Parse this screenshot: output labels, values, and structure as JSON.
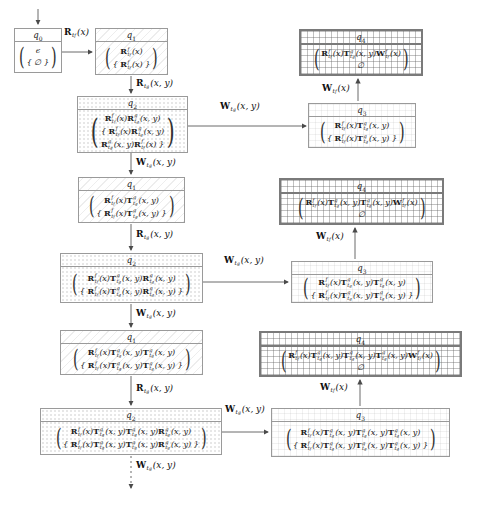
{
  "figure": {
    "states": {
      "q0": {
        "name": "q",
        "sub": "0",
        "kind": "q0",
        "lines": [
          [
            {
              "txt": "ϵ"
            }
          ],
          [
            {
              "txt": "{ ∅ }"
            }
          ]
        ]
      },
      "q1a": {
        "name": "q",
        "sub": "1",
        "kind": "q1",
        "lines": [
          [
            {
              "b": "R",
              "p": "f",
              "s": "t",
              "ss": "f",
              "a": "(x)"
            }
          ],
          [
            {
              "txt": "{ "
            },
            {
              "b": "R",
              "p": "f",
              "s": "t",
              "ss": "f",
              "a": "(x)"
            },
            {
              "txt": " }"
            }
          ]
        ]
      },
      "q2a": {
        "name": "q",
        "sub": "2",
        "kind": "q2",
        "lines": [
          [
            {
              "b": "R",
              "p": "f",
              "s": "t",
              "ss": "f",
              "a": "(x)"
            },
            {
              "b": "R",
              "p": "g",
              "s": "t",
              "ss": "g",
              "a": "(x, y)"
            }
          ],
          [
            {
              "txt": "{ "
            },
            {
              "b": "R",
              "p": "f",
              "s": "t",
              "ss": "f",
              "a": "(x)"
            },
            {
              "b": "R",
              "p": "g",
              "s": "t",
              "ss": "g",
              "a": "(x, y)"
            }
          ],
          [
            {
              "b": "R",
              "p": "g",
              "s": "t",
              "ss": "g",
              "a": "(x, y)"
            },
            {
              "b": "R",
              "p": "f",
              "s": "t",
              "ss": "f",
              "a": "(x)"
            },
            {
              "txt": " }"
            }
          ]
        ]
      },
      "q3a": {
        "name": "q",
        "sub": "3",
        "kind": "q3",
        "lines": [
          [
            {
              "b": "R",
              "p": "f",
              "s": "t",
              "ss": "f",
              "a": "(x)"
            },
            {
              "b": "T",
              "p": "g",
              "s": "t",
              "ss": "g",
              "a": "(x, y)"
            }
          ],
          [
            {
              "txt": "{ "
            },
            {
              "b": "R",
              "p": "f",
              "s": "t",
              "ss": "f",
              "a": "(x)"
            },
            {
              "b": "T",
              "p": "g",
              "s": "t",
              "ss": "g",
              "a": "(x, y)"
            },
            {
              "txt": " }"
            }
          ]
        ]
      },
      "q4a": {
        "name": "q",
        "sub": "4",
        "kind": "q4",
        "lines": [
          [
            {
              "b": "R",
              "p": "f",
              "s": "t",
              "ss": "f",
              "a": "(x)"
            },
            {
              "b": "T",
              "p": "g",
              "s": "t",
              "ss": "g",
              "a": "(x, y)"
            },
            {
              "b": "W",
              "p": "f",
              "s": "t",
              "ss": "f",
              "a": "(x)"
            }
          ],
          [
            {
              "txt": "∅"
            }
          ]
        ]
      },
      "q1b": {
        "name": "q",
        "sub": "1",
        "kind": "q1",
        "lines": [
          [
            {
              "b": "R",
              "p": "f",
              "s": "t",
              "ss": "f",
              "a": "(x)"
            },
            {
              "b": "T",
              "p": "g",
              "s": "t",
              "ss": "g",
              "a": "(x, y)"
            }
          ],
          [
            {
              "txt": "{ "
            },
            {
              "b": "R",
              "p": "f",
              "s": "t",
              "ss": "f",
              "a": "(x)"
            },
            {
              "b": "T",
              "p": "g",
              "s": "t",
              "ss": "g",
              "a": "(x, y)"
            },
            {
              "txt": " }"
            }
          ]
        ]
      },
      "q2b": {
        "name": "q",
        "sub": "2",
        "kind": "q2",
        "lines": [
          [
            {
              "b": "R",
              "p": "f",
              "s": "t",
              "ss": "f",
              "a": "(x)"
            },
            {
              "b": "T",
              "p": "g",
              "s": "t",
              "ss": "g",
              "a": "(x, y)"
            },
            {
              "b": "R",
              "p": "g",
              "s": "t",
              "ss": "g",
              "a": "(x, y)"
            }
          ],
          [
            {
              "txt": "{ "
            },
            {
              "b": "R",
              "p": "f",
              "s": "t",
              "ss": "f",
              "a": "(x)"
            },
            {
              "b": "T",
              "p": "g",
              "s": "t",
              "ss": "g",
              "a": "(x, y)"
            },
            {
              "b": "R",
              "p": "g",
              "s": "t",
              "ss": "g",
              "a": "(x, y)"
            },
            {
              "txt": " }"
            }
          ]
        ]
      },
      "q3b": {
        "name": "q",
        "sub": "3",
        "kind": "q3",
        "lines": [
          [
            {
              "b": "R",
              "p": "f",
              "s": "t",
              "ss": "f",
              "a": "(x)"
            },
            {
              "b": "T",
              "p": "g",
              "s": "t",
              "ss": "g",
              "a": "(x, y)"
            },
            {
              "b": "T",
              "p": "g",
              "s": "t",
              "ss": "g",
              "a": "(x, y)"
            }
          ],
          [
            {
              "txt": "{ "
            },
            {
              "b": "R",
              "p": "f",
              "s": "t",
              "ss": "f",
              "a": "(x)"
            },
            {
              "b": "T",
              "p": "g",
              "s": "t",
              "ss": "g",
              "a": "(x, y)"
            },
            {
              "b": "T",
              "p": "g",
              "s": "t",
              "ss": "g",
              "a": "(x, y)"
            },
            {
              "txt": " }"
            }
          ]
        ]
      },
      "q4b": {
        "name": "q",
        "sub": "4",
        "kind": "q4",
        "lines": [
          [
            {
              "b": "R",
              "p": "f",
              "s": "t",
              "ss": "f",
              "a": "(x)"
            },
            {
              "b": "T",
              "p": "g",
              "s": "t",
              "ss": "g",
              "a": "(x, y)"
            },
            {
              "b": "T",
              "p": "g",
              "s": "t",
              "ss": "g",
              "a": "(x, y)"
            },
            {
              "b": "W",
              "p": "f",
              "s": "t",
              "ss": "f",
              "a": "(x)"
            }
          ],
          [
            {
              "txt": "∅"
            }
          ]
        ]
      },
      "q1c": {
        "name": "q",
        "sub": "1",
        "kind": "q1",
        "lines": [
          [
            {
              "b": "R",
              "p": "f",
              "s": "t",
              "ss": "f",
              "a": "(x)"
            },
            {
              "b": "T",
              "p": "g",
              "s": "t",
              "ss": "g",
              "a": "(x, y)"
            },
            {
              "b": "T",
              "p": "g",
              "s": "t",
              "ss": "g",
              "a": "(x, y)"
            }
          ],
          [
            {
              "txt": "{ "
            },
            {
              "b": "R",
              "p": "f",
              "s": "t",
              "ss": "f",
              "a": "(x)"
            },
            {
              "b": "T",
              "p": "g",
              "s": "t",
              "ss": "g",
              "a": "(x, y)"
            },
            {
              "b": "T",
              "p": "g",
              "s": "t",
              "ss": "g",
              "a": "(x, y)"
            },
            {
              "txt": " }"
            }
          ]
        ]
      },
      "q2c": {
        "name": "q",
        "sub": "2",
        "kind": "q2",
        "lines": [
          [
            {
              "b": "R",
              "p": "f",
              "s": "t",
              "ss": "f",
              "a": "(x)"
            },
            {
              "b": "T",
              "p": "g",
              "s": "t",
              "ss": "g",
              "a": "(x, y)"
            },
            {
              "b": "T",
              "p": "g",
              "s": "t",
              "ss": "g",
              "a": "(x, y)"
            },
            {
              "b": "R",
              "p": "g",
              "s": "t",
              "ss": "g",
              "a": "(x, y)"
            }
          ],
          [
            {
              "txt": "{ "
            },
            {
              "b": "R",
              "p": "f",
              "s": "t",
              "ss": "f",
              "a": "(x)"
            },
            {
              "b": "T",
              "p": "g",
              "s": "t",
              "ss": "g",
              "a": "(x, y)"
            },
            {
              "b": "T",
              "p": "g",
              "s": "t",
              "ss": "g",
              "a": "(x, y)"
            },
            {
              "b": "R",
              "p": "g",
              "s": "t",
              "ss": "g",
              "a": "(x, y)"
            },
            {
              "txt": " }"
            }
          ]
        ]
      },
      "q3c": {
        "name": "q",
        "sub": "3",
        "kind": "q3",
        "lines": [
          [
            {
              "b": "R",
              "p": "f",
              "s": "t",
              "ss": "f",
              "a": "(x)"
            },
            {
              "b": "T",
              "p": "g",
              "s": "t",
              "ss": "g",
              "a": "(x, y)"
            },
            {
              "b": "T",
              "p": "g",
              "s": "t",
              "ss": "g",
              "a": "(x, y)"
            },
            {
              "b": "T",
              "p": "g",
              "s": "t",
              "ss": "g",
              "a": "(x, y)"
            }
          ],
          [
            {
              "txt": "{ "
            },
            {
              "b": "R",
              "p": "f",
              "s": "t",
              "ss": "f",
              "a": "(x)"
            },
            {
              "b": "T",
              "p": "g",
              "s": "t",
              "ss": "g",
              "a": "(x, y)"
            },
            {
              "b": "T",
              "p": "g",
              "s": "t",
              "ss": "g",
              "a": "(x, y)"
            },
            {
              "b": "T",
              "p": "g",
              "s": "t",
              "ss": "g",
              "a": "(x, y)"
            },
            {
              "txt": " }"
            }
          ]
        ]
      },
      "q4c": {
        "name": "q",
        "sub": "4",
        "kind": "q4",
        "lines": [
          [
            {
              "b": "R",
              "p": "f",
              "s": "t",
              "ss": "f",
              "a": "(x)"
            },
            {
              "b": "T",
              "p": "g",
              "s": "t",
              "ss": "g",
              "a": "(x, y)"
            },
            {
              "b": "T",
              "p": "g",
              "s": "t",
              "ss": "g",
              "a": "(x, y)"
            },
            {
              "b": "T",
              "p": "g",
              "s": "t",
              "ss": "g",
              "a": "(x, y)"
            },
            {
              "b": "W",
              "p": "f",
              "s": "t",
              "ss": "f",
              "a": "(x)"
            }
          ],
          [
            {
              "txt": "∅"
            }
          ]
        ]
      }
    },
    "edges": {
      "q0_q1": {
        "label": [
          {
            "b": "R",
            "s": "t",
            "ss": "f",
            "a": "(x)"
          }
        ]
      },
      "q1a_q2a": {
        "label": [
          {
            "b": "R",
            "s": "t",
            "ss": "g",
            "a": "(x, y)"
          }
        ]
      },
      "q2a_q3a": {
        "label": [
          {
            "b": "W",
            "s": "t",
            "ss": "g",
            "a": "(x, y)"
          }
        ]
      },
      "q3a_q4a": {
        "label": [
          {
            "b": "W",
            "s": "t",
            "ss": "f",
            "a": "(x)"
          }
        ]
      },
      "q2a_q1b": {
        "label": [
          {
            "b": "W",
            "s": "t",
            "ss": "g",
            "a": "(x, y)"
          }
        ]
      },
      "q1b_q2b": {
        "label": [
          {
            "b": "R",
            "s": "t",
            "ss": "g",
            "a": "(x, y)"
          }
        ]
      },
      "q2b_q3b": {
        "label": [
          {
            "b": "W",
            "s": "t",
            "ss": "g",
            "a": "(x, y)"
          }
        ]
      },
      "q3b_q4b": {
        "label": [
          {
            "b": "W",
            "s": "t",
            "ss": "f",
            "a": "(x)"
          }
        ]
      },
      "q2b_q1c": {
        "label": [
          {
            "b": "W",
            "s": "t",
            "ss": "g",
            "a": "(x, y)"
          }
        ]
      },
      "q1c_q2c": {
        "label": [
          {
            "b": "R",
            "s": "t",
            "ss": "g",
            "a": "(x, y)"
          }
        ]
      },
      "q2c_q3c": {
        "label": [
          {
            "b": "W",
            "s": "t",
            "ss": "g",
            "a": "(x, y)"
          }
        ]
      },
      "q3c_q4c": {
        "label": [
          {
            "b": "W",
            "s": "t",
            "ss": "f",
            "a": "(x)"
          }
        ]
      },
      "q2c_cont": {
        "label": [
          {
            "b": "W",
            "s": "t",
            "ss": "g",
            "a": "(x, y)"
          }
        ]
      }
    }
  }
}
